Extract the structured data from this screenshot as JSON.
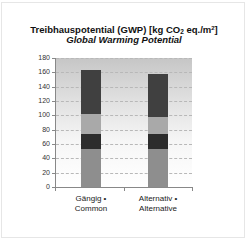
{
  "title": {
    "line1_prefix": "Treibhauspotential (GWP) [kg CO",
    "line1_sub": "2",
    "line1_mid": " eq./m",
    "line1_sup": "2",
    "line1_suffix": "]",
    "line2": "Global Warming Potential"
  },
  "y_ticks": [
    "0",
    "20",
    "40",
    "60",
    "80",
    "100",
    "120",
    "140",
    "160",
    "180"
  ],
  "x_labels": [
    {
      "line1": "Gängig •",
      "line2": "Common"
    },
    {
      "line1": "Alternativ •",
      "line2": "Alternative"
    }
  ],
  "colors": {
    "segment_1": "#8e8e8e",
    "segment_2": "#2c2c2c",
    "segment_3": "#a9a9a9",
    "segment_4": "#404040"
  },
  "chart_data": {
    "type": "bar",
    "stacked": true,
    "categories": [
      "Gängig • Common",
      "Alternativ • Alternative"
    ],
    "series": [
      {
        "name": "Segment 1 (bottom, mid gray)",
        "values": [
          53,
          53
        ]
      },
      {
        "name": "Segment 2 (dark)",
        "values": [
          21,
          21
        ]
      },
      {
        "name": "Segment 3 (light gray)",
        "values": [
          28,
          24
        ]
      },
      {
        "name": "Segment 4 (top, dark)",
        "values": [
          61,
          60
        ]
      }
    ],
    "totals": [
      163,
      158
    ],
    "xlabel": "",
    "ylabel": "",
    "ylim": [
      0,
      180
    ],
    "yticks": [
      0,
      20,
      40,
      60,
      80,
      100,
      120,
      140,
      160,
      180
    ],
    "grid": "horizontal dashed",
    "legend": "none"
  }
}
